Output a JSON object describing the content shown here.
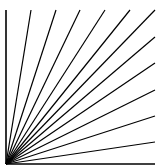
{
  "figure": {
    "background": "#ffffff",
    "stroke": "#000000",
    "origin": [
      6,
      164
    ],
    "rays": [
      {
        "to": [
          6,
          10
        ]
      },
      {
        "to": [
          31,
          10
        ]
      },
      {
        "to": [
          56,
          10
        ]
      },
      {
        "to": [
          80,
          10
        ]
      },
      {
        "to": [
          105,
          10
        ]
      },
      {
        "to": [
          130,
          10
        ]
      },
      {
        "to": [
          155,
          10
        ]
      },
      {
        "to": [
          155,
          37
        ]
      },
      {
        "to": [
          155,
          63
        ]
      },
      {
        "to": [
          155,
          90
        ]
      },
      {
        "to": [
          155,
          116
        ]
      },
      {
        "to": [
          155,
          142
        ]
      },
      {
        "to": [
          155,
          164
        ]
      }
    ]
  }
}
